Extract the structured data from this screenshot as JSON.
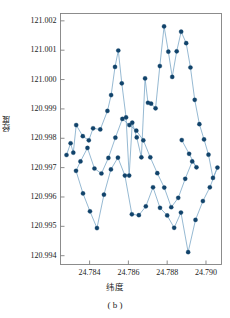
{
  "chart_data": {
    "type": "scatter",
    "title": "",
    "subtitle": "",
    "caption": "( b )",
    "xlabel": "纬度",
    "ylabel": "经度",
    "xlim": [
      24.7825,
      24.7908
    ],
    "ylim": [
      120.9937,
      121.00225
    ],
    "xticks": [
      24.784,
      24.786,
      24.788,
      24.79
    ],
    "xticklabels": [
      "24.784",
      "24.786",
      "24.788",
      "24.790"
    ],
    "yticks": [
      120.994,
      120.995,
      120.996,
      120.997,
      120.998,
      120.999,
      121.0,
      121.001,
      121.002
    ],
    "yticklabels": [
      "120.994",
      "120.995",
      "120.996",
      "120.997",
      "120.998",
      "120.999",
      "121.000",
      "121.001",
      "121.002"
    ],
    "grid": false,
    "legend": null,
    "marker_color": "#11436b",
    "line_color": "#7ba7c7",
    "marker_size": 4.2,
    "line_width": 0.8,
    "series": [
      {
        "name": "轨迹",
        "x": [
          24.78281,
          24.78302,
          24.78316,
          24.78331,
          24.78365,
          24.78396,
          24.78418,
          24.78455,
          24.78492,
          24.78511,
          24.78531,
          24.78548,
          24.78566,
          24.78588,
          24.78604,
          24.7862,
          24.78643,
          24.78667,
          24.78686,
          24.78701,
          24.78717,
          24.7874,
          24.78762,
          24.78784,
          24.78806,
          24.78826,
          24.78849,
          24.78872,
          24.78898,
          24.7892,
          24.78942,
          24.78966,
          24.7899,
          24.79013,
          24.79036,
          24.79059,
          24.7902,
          24.78984,
          24.78946,
          24.78908,
          24.78871,
          24.78836,
          24.788,
          24.78763,
          24.78727,
          24.7869,
          24.78654,
          24.78618,
          24.78582,
          24.78546,
          24.7851,
          24.78474,
          24.78438,
          24.78402,
          24.78366,
          24.7833,
          24.78353,
          24.78389,
          24.78425,
          24.78461,
          24.78497,
          24.78533,
          24.78569,
          24.78605,
          24.78641,
          24.78677,
          24.78713,
          24.78749,
          24.78785,
          24.78821,
          24.78857,
          24.78893,
          24.78929,
          24.78951,
          24.78913,
          24.78875
        ],
        "y": [
          120.99743,
          120.99783,
          120.99751,
          120.99845,
          120.99807,
          120.99793,
          120.99834,
          120.9983,
          120.99893,
          120.99947,
          121.00043,
          121.00099,
          120.99987,
          120.99871,
          120.99673,
          120.99853,
          120.99803,
          120.99735,
          121.00004,
          120.99921,
          120.99918,
          120.99902,
          121.00046,
          121.00181,
          121.00095,
          121.00009,
          121.00096,
          121.00163,
          121.00124,
          121.00041,
          120.99931,
          120.99848,
          120.99796,
          120.99744,
          120.99665,
          120.997,
          120.99633,
          120.99586,
          120.99522,
          120.99412,
          120.99547,
          120.99495,
          120.99537,
          120.99563,
          120.99633,
          120.99568,
          120.99538,
          120.99541,
          120.99673,
          120.99734,
          120.99694,
          120.99608,
          120.99494,
          120.99551,
          120.99612,
          120.99689,
          120.99721,
          120.99767,
          120.99697,
          120.9968,
          120.99733,
          120.99802,
          120.99866,
          120.99845,
          120.99826,
          120.99793,
          120.99735,
          120.99681,
          120.99632,
          120.99565,
          120.99597,
          120.99662,
          120.99721,
          120.99701,
          120.99747,
          120.99794
        ]
      }
    ]
  }
}
